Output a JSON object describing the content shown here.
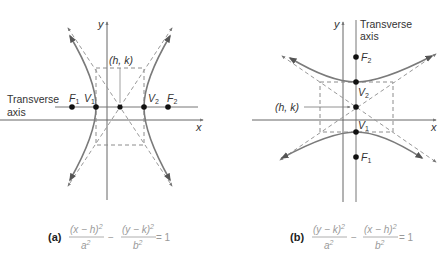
{
  "figure": {
    "panels": [
      {
        "id": "a",
        "label": "(a)",
        "orientation": "horizontal transverse axis",
        "axis_x": "x",
        "axis_y": "y",
        "transverse_axis_label_line1": "Transverse",
        "transverse_axis_label_line2": "axis",
        "center_label": "(h, k)",
        "points": [
          {
            "name": "F",
            "sub": "1"
          },
          {
            "name": "V",
            "sub": "1"
          },
          {
            "name": "V",
            "sub": "2"
          },
          {
            "name": "F",
            "sub": "2"
          }
        ],
        "equation": {
          "term1_num": "(x − h)",
          "term1_num_exp": "2",
          "term1_den": "a",
          "term1_den_exp": "2",
          "operator": "−",
          "term2_num": "(y − k)",
          "term2_num_exp": "2",
          "term2_den": "b",
          "term2_den_exp": "2",
          "rhs": "= 1"
        }
      },
      {
        "id": "b",
        "label": "(b)",
        "orientation": "vertical transverse axis",
        "axis_x": "x",
        "axis_y": "y",
        "transverse_axis_label_line1": "Transverse",
        "transverse_axis_label_line2": "axis",
        "center_label": "(h, k)",
        "points": [
          {
            "name": "F",
            "sub": "2"
          },
          {
            "name": "V",
            "sub": "2"
          },
          {
            "name": "V",
            "sub": "1"
          },
          {
            "name": "F",
            "sub": "1"
          }
        ],
        "equation": {
          "term1_num": "(y − k)",
          "term1_num_exp": "2",
          "term1_den": "a",
          "term1_den_exp": "2",
          "operator": "−",
          "term2_num": "(x − h)",
          "term2_num_exp": "2",
          "term2_den": "b",
          "term2_den_exp": "2",
          "rhs": "= 1"
        }
      }
    ],
    "colors": {
      "curve": "#7a7a7a",
      "axis": "#666666",
      "dashed": "#8c8c8c",
      "point": "#111111",
      "equation": "#9a9a9a"
    }
  }
}
